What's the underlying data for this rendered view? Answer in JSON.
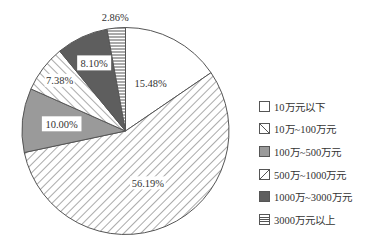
{
  "chart_data": {
    "type": "pie",
    "title": "",
    "start_angle_deg": 0,
    "direction": "clockwise",
    "slices": [
      {
        "label": "10万元以下",
        "value": 15.48,
        "display": "15.48%",
        "fill": "#ffffff",
        "pattern": "none"
      },
      {
        "label": "10万~100万元",
        "value": 56.19,
        "display": "56.19%",
        "fill": "#ffffff",
        "pattern": "diag-back"
      },
      {
        "label": "100万~500万元",
        "value": 10.0,
        "display": "10.00%",
        "fill": "#9a9a9a",
        "pattern": "none"
      },
      {
        "label": "500万~1000万元",
        "value": 7.38,
        "display": "7.38%",
        "fill": "#ffffff",
        "pattern": "diag-fwd"
      },
      {
        "label": "1000万~3000万元",
        "value": 8.1,
        "display": "8.10%",
        "fill": "#5e5e5e",
        "pattern": "none"
      },
      {
        "label": "3000万元以上",
        "value": 2.86,
        "display": "2.86%",
        "fill": "#ffffff",
        "pattern": "horizontal"
      }
    ],
    "legend_position": "right"
  },
  "legend": {
    "items": [
      {
        "label": "10万元以下"
      },
      {
        "label": "10万~100万元"
      },
      {
        "label": "100万~500万元"
      },
      {
        "label": "500万~1000万元"
      },
      {
        "label": "1000万~3000万元"
      },
      {
        "label": "3000万元以上"
      }
    ]
  },
  "colors": {
    "outline": "#555555",
    "hatch": "#555555",
    "mid_gray": "#9a9a9a",
    "dark_gray": "#5e5e5e"
  }
}
